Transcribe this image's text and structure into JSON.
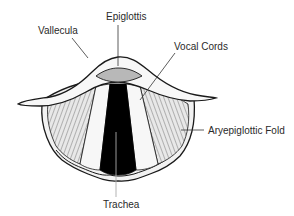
{
  "diagram": {
    "labels": {
      "epiglottis": "Epiglottis",
      "vallecula": "Vallecula",
      "vocal_cords": "Vocal Cords",
      "aryepiglottic_fold": "Aryepiglottic Fold",
      "trachea": "Trachea"
    },
    "colors": {
      "outline": "#1a1a1a",
      "trachea_opening": "#000000",
      "epiglottis_surface": "#b8b8b8",
      "fold_fill": "#f2f2f2",
      "hatch_fill": "#e0e0e0",
      "leader_line": "#333333",
      "label_text": "#2a2a2a"
    }
  }
}
